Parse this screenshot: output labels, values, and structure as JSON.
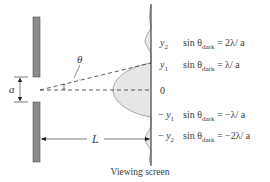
{
  "diagram": {
    "type": "single-slit-diffraction",
    "slit_width_label": "a",
    "distance_label": "L",
    "angle_label": "θ",
    "screen_caption": "Viewing screen",
    "positions": [
      {
        "label_y": "y",
        "label_sub": "2",
        "sign": "",
        "equation_prefix": "sin θ",
        "equation_sub": "dark",
        "equation_rhs": " = 2λ/ a"
      },
      {
        "label_y": "y",
        "label_sub": "1",
        "sign": "",
        "equation_prefix": "sin θ",
        "equation_sub": "dark",
        "equation_rhs": " = λ/ a"
      },
      {
        "label_y": "0",
        "label_sub": "",
        "sign": ""
      },
      {
        "label_y": "y",
        "label_sub": "1",
        "sign": "− ",
        "equation_prefix": "sin θ",
        "equation_sub": "dark",
        "equation_rhs": " = −λ/ a"
      },
      {
        "label_y": "y",
        "label_sub": "2",
        "sign": "− ",
        "equation_prefix": "sin θ",
        "equation_sub": "dark",
        "equation_rhs": " = −2λ/ a"
      }
    ],
    "colors": {
      "barrier": "#8a8a8a",
      "barrier_stroke": "#555555",
      "intensity_fill": "#e6e6e6",
      "line": "#444444"
    }
  }
}
